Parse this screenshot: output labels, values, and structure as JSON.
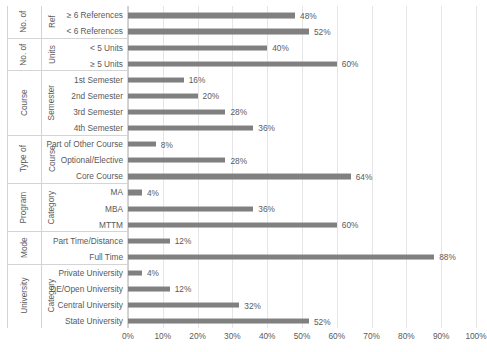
{
  "chart_data": {
    "type": "bar",
    "orientation": "horizontal",
    "title": "",
    "xlabel": "",
    "ylabel": "",
    "xlim": [
      0,
      100
    ],
    "xtick_labels": [
      "0%",
      "10%",
      "20%",
      "30%",
      "40%",
      "50%",
      "60%",
      "70%",
      "80%",
      "90%",
      "100%"
    ],
    "xtick_values": [
      0,
      10,
      20,
      30,
      40,
      50,
      60,
      70,
      80,
      90,
      100
    ],
    "grid": true,
    "legend": false,
    "bar_color": "#808080",
    "gridline_color": "#e6e6e6",
    "axis_color": "#d4d4d4",
    "value_suffix": "%",
    "categories": [
      "≥ 6 References",
      "< 6 References",
      "< 5 Units",
      "≥ 5 Units",
      "1st Semester",
      "2nd Semester",
      "3rd Semester",
      "4th Semester",
      "Part of Other Course",
      "Optional/Elective",
      "Core Course",
      "MA",
      "MBA",
      "MTTM",
      "Part Time/Distance",
      "Full Time",
      "Private University",
      "DE/Open University",
      "Central University",
      "State University"
    ],
    "values": [
      48,
      52,
      40,
      60,
      16,
      20,
      28,
      36,
      8,
      28,
      64,
      4,
      36,
      60,
      12,
      88,
      4,
      12,
      32,
      52
    ],
    "value_labels": [
      "48%",
      "52%",
      "40%",
      "60%",
      "16%",
      "20%",
      "28%",
      "36%",
      "8%",
      "28%",
      "64%",
      "4%",
      "36%",
      "60%",
      "12%",
      "88%",
      "4%",
      "12%",
      "32%",
      "52%"
    ],
    "groups": [
      {
        "label": "No. of\nRef",
        "label_line1": "No. of",
        "label_line2": "Ref",
        "count": 2
      },
      {
        "label": "No. of\nUnits",
        "label_line1": "No. of",
        "label_line2": "Units",
        "count": 2
      },
      {
        "label": "Course\nSemester",
        "label_line1": "Course",
        "label_line2": "Semester",
        "count": 4
      },
      {
        "label": "Type of\nCourse",
        "label_line1": "Type of",
        "label_line2": "Course",
        "count": 3
      },
      {
        "label": "Program\nCategory",
        "label_line1": "Program",
        "label_line2": "Category",
        "count": 3
      },
      {
        "label": "Mode",
        "label_line1": "Mode",
        "label_line2": "",
        "count": 2
      },
      {
        "label": "University\nCategory",
        "label_line1": "University",
        "label_line2": "Category",
        "count": 4
      }
    ]
  }
}
